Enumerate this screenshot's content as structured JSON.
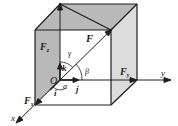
{
  "diagram": {
    "colors": {
      "shaded_face": "#b9b9b9",
      "light_face": "#dcdcdc",
      "line": "#1e1e1e",
      "background": "#ffffff"
    },
    "labels": {
      "force": "F",
      "force_x": "F",
      "force_x_sub": "x",
      "force_y": "F",
      "force_y_sub": "y",
      "force_z": "F",
      "force_z_sub": "z",
      "origin": "O",
      "unit_i": "i",
      "unit_j": "j",
      "unit_k": "k",
      "angle_alpha": "α",
      "angle_beta": "β",
      "angle_gamma": "γ",
      "axis_x": "x",
      "axis_y": "y"
    }
  }
}
